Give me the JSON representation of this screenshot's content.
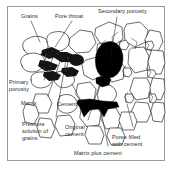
{
  "figure": {
    "frame": {
      "border_color": "#9a9a9a",
      "background": "#ffffff"
    },
    "colors": {
      "grain_outline": "#1a1a1a",
      "grain_fill": "#ffffff",
      "pore_fill": "#000000",
      "cement_fill": "#111111",
      "matrix_fill": "#3a3a3a",
      "leader_line": "#1a1a1a",
      "text": "#2b2b2b"
    }
  },
  "labels": {
    "grains": "Grains",
    "pore_throat": "Pore throat",
    "secondary_porosity": "Secondary porosity",
    "primary_porosity_line1": "Primary",
    "primary_porosity_line2": "porosity",
    "matrix": "Matrix",
    "cement": "Cement",
    "pressure_solution_line1": "Pressure",
    "pressure_solution_line2": "solution of",
    "pressure_solution_line3": "grains",
    "original_cement_line1": "Original",
    "original_cement_line2": "cement",
    "pores_filled_line1": "Pores filled",
    "pores_filled_line2": "with cement",
    "matrix_plus_cement": "Matrix plus cement"
  }
}
